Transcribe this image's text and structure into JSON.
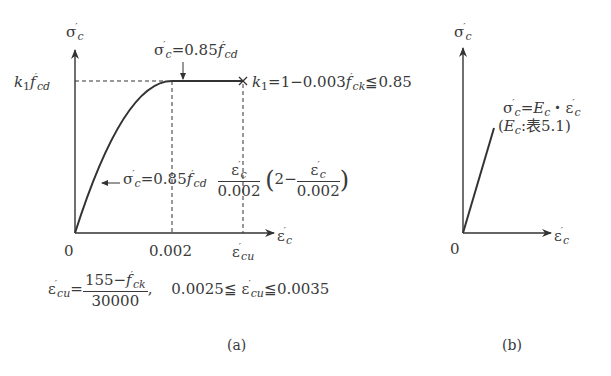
{
  "figure": {
    "panel_a": {
      "y_axis_label": "σ′c",
      "x_axis_label": "ε′c",
      "y_level_label": "k1 f′cd",
      "plateau_label": "σ′c=0.85f′cd",
      "k1_formula": "k1 = 1 − 0.003 f′ck ≦ 0.85",
      "curve_formula": "σ′c = 0.85 f′cd (ε′c/0.002)(2 − ε′c/0.002)",
      "x_ticks": [
        "0",
        "0.002",
        "ε′cu"
      ],
      "ecu_formula": "ε′cu = (155 − f′ck)/30000,  0.0025 ≦ ε′cu ≦ 0.0035",
      "caption": "(a)"
    },
    "panel_b": {
      "y_axis_label": "σ′c",
      "x_axis_label": "ε′c",
      "origin_label": "0",
      "linear_formula": "σ′c = Ec・ε′c",
      "ec_note": "(Ec:表5.1)",
      "caption": "(b)"
    }
  },
  "text": {
    "sigma": "σ",
    "eps": "ε",
    "prime": "′",
    "c": "c",
    "cd": "cd",
    "ck": "ck",
    "cu": "cu",
    "k": "k",
    "one": "1",
    "f": "f",
    "eq_085": "=0.85",
    "eq_1_minus": "=1−0.003",
    "le_085": "≦0.85",
    "zero": "0",
    "tick_0002": "0.002",
    "den_0002": "0.002",
    "open_paren": "(",
    "close_paren": ")",
    "two_minus": "2−",
    "eq": "=",
    "num_155": "155−",
    "den_30000": "30000",
    "comma": ",",
    "lo_bound": "0.0025≦",
    "hi_bound": "≦0.0035",
    "E": "E",
    "dot": "・",
    "ec_note_pre": "(",
    "ec_note_post": ":表5.1)",
    "cap_a": "(a)",
    "cap_b": "(b)"
  },
  "colors": {
    "line": "#333333",
    "text": "#3a3a3a",
    "background": "#ffffff"
  }
}
